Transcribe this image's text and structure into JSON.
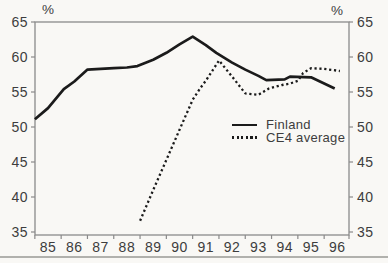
{
  "colors": {
    "background": "#f9f8f5",
    "axis": "#8a8a8a",
    "line": "#1b1b1b",
    "text": "#3d3d3d",
    "bottom_rule": "#b1b1ad"
  },
  "chart_data": {
    "type": "line",
    "title": "",
    "yaxis_unit_left": "%",
    "yaxis_unit_right": "%",
    "xlim": [
      84.5,
      96.45
    ],
    "ylim": [
      35,
      65
    ],
    "grid": false,
    "x_ticks": [
      85,
      86,
      87,
      88,
      89,
      90,
      91,
      92,
      93,
      94,
      95,
      96
    ],
    "x_tick_labels": [
      "85",
      "86",
      "87",
      "88",
      "89",
      "90",
      "91",
      "92",
      "93",
      "94",
      "95",
      "96"
    ],
    "y_ticks": [
      65,
      60,
      55,
      50,
      45,
      40,
      35
    ],
    "y_tick_labels_left": [
      "65",
      "60",
      "55",
      "50",
      "45",
      "40",
      "35"
    ],
    "y_tick_labels_right": [
      "65",
      "60",
      "55",
      "50",
      "45",
      "40",
      "35"
    ],
    "legend_position": "inside-right-middle",
    "series": [
      {
        "name": "Finland",
        "style": "solid",
        "points": [
          [
            84.5,
            51.1
          ],
          [
            85,
            52.7
          ],
          [
            85.6,
            55.4
          ],
          [
            86,
            56.5
          ],
          [
            86.5,
            58.2
          ],
          [
            87,
            58.3
          ],
          [
            87.5,
            58.4
          ],
          [
            88,
            58.5
          ],
          [
            88.4,
            58.7
          ],
          [
            89,
            59.6
          ],
          [
            89.5,
            60.6
          ],
          [
            90,
            61.8
          ],
          [
            90.5,
            62.9
          ],
          [
            91,
            61.7
          ],
          [
            91.4,
            60.6
          ],
          [
            92,
            59.2
          ],
          [
            92.5,
            58.2
          ],
          [
            93,
            57.3
          ],
          [
            93.3,
            56.7
          ],
          [
            94,
            56.8
          ],
          [
            94.2,
            57.2
          ],
          [
            95,
            57.1
          ],
          [
            95.9,
            55.5
          ]
        ]
      },
      {
        "name": "CE4 average",
        "style": "dotted",
        "points": [
          [
            88.5,
            36.6
          ],
          [
            89,
            41.0
          ],
          [
            89.5,
            45.3
          ],
          [
            90,
            49.6
          ],
          [
            90.5,
            53.9
          ],
          [
            90.8,
            55.6
          ],
          [
            91,
            56.6
          ],
          [
            91.5,
            59.5
          ],
          [
            92,
            57.2
          ],
          [
            92.5,
            54.8
          ],
          [
            93,
            54.6
          ],
          [
            93.4,
            55.5
          ],
          [
            93.9,
            56.0
          ],
          [
            94.2,
            56.2
          ],
          [
            94.5,
            56.6
          ],
          [
            94.7,
            57.7
          ],
          [
            95,
            58.4
          ],
          [
            95.5,
            58.3
          ],
          [
            96.1,
            58.0
          ]
        ]
      }
    ]
  },
  "legend": {
    "items": [
      {
        "label": "Finland"
      },
      {
        "label": "CE4 average"
      }
    ]
  }
}
